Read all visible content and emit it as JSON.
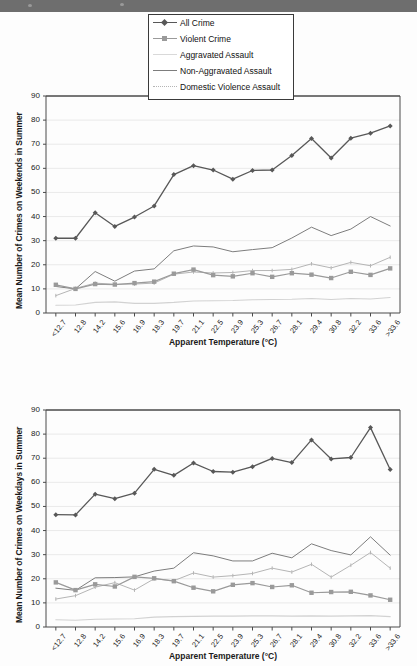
{
  "chrome": {
    "topbar_color": "#6e6e6e"
  },
  "colors": {
    "all_crime": "#585858",
    "violent_crime": "#9a9a9a",
    "aggravated_assault": "#d2d2d2",
    "non_aggravated_assault": "#7d7d7d",
    "domestic_violence_assault": "#b5b5b5",
    "axis": "#4a4a4a",
    "grid": "#e4e4e4",
    "text": "#1a1a1a",
    "legend_border": "#3a3a3a"
  },
  "legend": {
    "position": "top-center",
    "entries": [
      {
        "label": "All Crime",
        "key": "line-marker-diamond",
        "color": "#585858"
      },
      {
        "label": "Violent Crime",
        "key": "line-marker-square",
        "color": "#9a9a9a"
      },
      {
        "label": "Aggravated Assault",
        "key": "line-plain-light",
        "color": "#d2d2d2"
      },
      {
        "label": "Non-Aggravated Assault",
        "key": "line-plain",
        "color": "#7d7d7d"
      },
      {
        "label": "Domestic Violence Assault",
        "key": "line-dotted",
        "color": "#b5b5b5"
      }
    ]
  },
  "chart_data": [
    {
      "id": "weekends",
      "type": "line",
      "title": "",
      "xlabel": "Apparent Temperature (°C)",
      "ylabel": "Mean Number of Crimes on Weekends in Summer",
      "ylim": [
        0,
        90
      ],
      "yticks": [
        0,
        10,
        20,
        30,
        40,
        50,
        60,
        70,
        80,
        90
      ],
      "grid": true,
      "categories": [
        "<12.7",
        "12.8",
        "14.2",
        "15.6",
        "16.9",
        "18.3",
        "19.7",
        "21.1",
        "22.5",
        "23.9",
        "25.3",
        "26.7",
        "28.1",
        "29.4",
        "30.8",
        "32.2",
        "33.6",
        ">33.6"
      ],
      "series": [
        {
          "name": "All Crime",
          "values": [
            31.0,
            31.0,
            41.6,
            35.9,
            39.8,
            44.4,
            57.4,
            61.1,
            59.3,
            55.5,
            59.1,
            59.3,
            65.3,
            72.4,
            64.3,
            72.5,
            74.6,
            77.6
          ]
        },
        {
          "name": "Violent Crime",
          "values": [
            11.7,
            10.0,
            12.0,
            11.8,
            12.4,
            13.0,
            16.3,
            18.0,
            15.7,
            15.2,
            16.5,
            15.0,
            16.5,
            15.9,
            14.5,
            17.1,
            15.8,
            18.5
          ]
        },
        {
          "name": "Aggravated Assault",
          "values": [
            3.2,
            3.3,
            4.4,
            4.6,
            4.0,
            4.0,
            4.4,
            5.0,
            5.1,
            5.2,
            5.5,
            5.6,
            5.7,
            6.0,
            5.6,
            6.0,
            5.8,
            6.4
          ]
        },
        {
          "name": "Non-Aggravated Assault",
          "values": [
            11.0,
            10.0,
            17.2,
            13.2,
            17.4,
            18.3,
            25.8,
            27.8,
            27.4,
            25.4,
            26.3,
            27.1,
            31.1,
            35.6,
            32.1,
            34.8,
            40.0,
            36.1
          ]
        },
        {
          "name": "Domestic Violence Assault",
          "values": [
            7.2,
            10.2,
            12.4,
            11.9,
            12.0,
            12.4,
            16.1,
            17.0,
            16.6,
            16.8,
            17.6,
            17.6,
            18.1,
            20.4,
            18.7,
            21.0,
            19.6,
            23.1
          ]
        }
      ]
    },
    {
      "id": "weekdays",
      "type": "line",
      "title": "",
      "xlabel": "Apparent Temperature (°C)",
      "ylabel": "Mean Number of Crimes on Weekdays in Summer",
      "ylim": [
        0,
        90
      ],
      "yticks": [
        0,
        10,
        20,
        30,
        40,
        50,
        60,
        70,
        80,
        90
      ],
      "grid": true,
      "categories": [
        "<12.7",
        "12.8",
        "14.2",
        "15.6",
        "16.9",
        "18.3",
        "19.7",
        "21.1",
        "22.5",
        "23.9",
        "25.3",
        "26.7",
        "28.1",
        "29.4",
        "30.8",
        "32.2",
        "33.6",
        ">33.6"
      ],
      "series": [
        {
          "name": "All Crime",
          "values": [
            46.6,
            46.5,
            55.1,
            53.2,
            55.5,
            65.4,
            62.9,
            68.0,
            64.5,
            64.2,
            66.5,
            69.9,
            68.2,
            77.6,
            69.7,
            70.3,
            82.7,
            65.3
          ]
        },
        {
          "name": "Violent Crime",
          "values": [
            18.5,
            15.3,
            17.7,
            16.8,
            20.8,
            20.2,
            19.0,
            16.3,
            14.8,
            17.5,
            18.2,
            16.6,
            17.3,
            14.2,
            14.5,
            14.6,
            13.1,
            11.3
          ]
        },
        {
          "name": "Aggravated Assault",
          "values": [
            3.0,
            2.8,
            3.2,
            3.3,
            3.4,
            4.1,
            4.3,
            4.4,
            4.5,
            4.5,
            4.6,
            4.6,
            4.5,
            4.6,
            4.5,
            4.6,
            4.7,
            4.3
          ]
        },
        {
          "name": "Non-Aggravated Assault",
          "values": [
            16.1,
            15.2,
            20.4,
            20.5,
            20.8,
            23.2,
            24.4,
            30.8,
            29.5,
            27.4,
            27.4,
            30.6,
            28.7,
            34.5,
            31.7,
            29.9,
            37.4,
            29.8
          ]
        },
        {
          "name": "Domestic Violence Assault",
          "values": [
            11.6,
            13.0,
            16.5,
            18.4,
            15.3,
            20.0,
            19.2,
            22.4,
            20.7,
            21.3,
            22.2,
            24.4,
            22.8,
            26.0,
            20.7,
            25.6,
            30.9,
            24.4
          ]
        }
      ]
    }
  ]
}
